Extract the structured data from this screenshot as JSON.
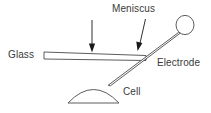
{
  "figure": {
    "background_color": "#ffffff",
    "stroke_color": "#4a4a4a",
    "fill_color": "#ffffff",
    "text_color": "#3a3a3a",
    "arrow_color": "#1a1a1a",
    "width": 211,
    "height": 113
  },
  "labels": {
    "glass": "Glass",
    "meniscus": "Meniscus",
    "electrode": "Electrode",
    "cell": "Cell"
  },
  "parts": {
    "glass_slide": {
      "name": "Glass",
      "shape": "thin horizontal bar",
      "x1": 44,
      "y1": 52,
      "x2": 146,
      "y2": 60
    },
    "electrode": {
      "name": "Electrode",
      "shape": "tapered pipette with round barrel end",
      "tip_x": 108,
      "tip_y": 85,
      "barrel_center_x": 185,
      "barrel_center_y": 25,
      "barrel_radius": 9
    },
    "cell": {
      "name": "Cell",
      "shape": "dome",
      "base_left_x": 68,
      "base_right_x": 119,
      "baseline_y": 103,
      "apex_y": 84
    },
    "arrow_glass": {
      "name": "arrow pointing to glass surface",
      "from_x": 92,
      "from_y": 20,
      "to_x": 92,
      "to_y": 52
    },
    "arrow_meniscus": {
      "name": "arrow pointing to meniscus",
      "from_x": 143,
      "from_y": 20,
      "to_x": 138,
      "to_y": 50
    }
  }
}
